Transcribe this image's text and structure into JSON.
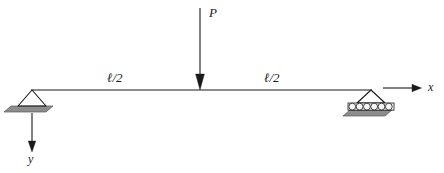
{
  "figure": {
    "name": "simply-supported-beam-with-central-point-load",
    "background_color": "#ffffff",
    "stroke_color": "#1a1a1a",
    "plate_fill_color": "#8c8c8c",
    "roller_fill_color": "#f2f2f2",
    "width": 444,
    "height": 173
  },
  "beam": {
    "label": "beam",
    "x_start": 31,
    "x_end": 372,
    "y": 90
  },
  "load": {
    "symbol": "P",
    "arrow_x": 200,
    "arrow_y_top": 8,
    "arrow_y_bottom": 90,
    "label_x": 209,
    "label_y": 6
  },
  "dimensions": [
    {
      "symbol": "ℓ/2",
      "name": "left-half-span",
      "label_x": 107,
      "label_y": 71
    },
    {
      "symbol": "ℓ/2",
      "name": "right-half-span",
      "label_x": 264,
      "label_y": 71
    }
  ],
  "supports": [
    {
      "name": "pin-support",
      "type": "pin",
      "apex_x": 32,
      "apex_y": 90,
      "base_y": 106,
      "half_width": 14,
      "plate_skew": 7,
      "plate_height": 6
    },
    {
      "name": "roller-support",
      "type": "roller",
      "apex_x": 371,
      "apex_y": 90,
      "base_y": 103,
      "half_width": 14,
      "plate_skew": 7,
      "plate_height": 5,
      "roller_count": 6,
      "roller_radius": 3.4
    }
  ],
  "axes": [
    {
      "name": "x-axis",
      "symbol": "x",
      "direction": "right",
      "line_x_start": 383,
      "line_x_end": 421,
      "line_y": 88,
      "label_x": 428,
      "label_y": 82
    },
    {
      "name": "y-axis",
      "symbol": "y",
      "direction": "down",
      "line_x": 32,
      "line_y_start": 113,
      "line_y_end": 152,
      "label_x": 28,
      "label_y": 155
    }
  ]
}
